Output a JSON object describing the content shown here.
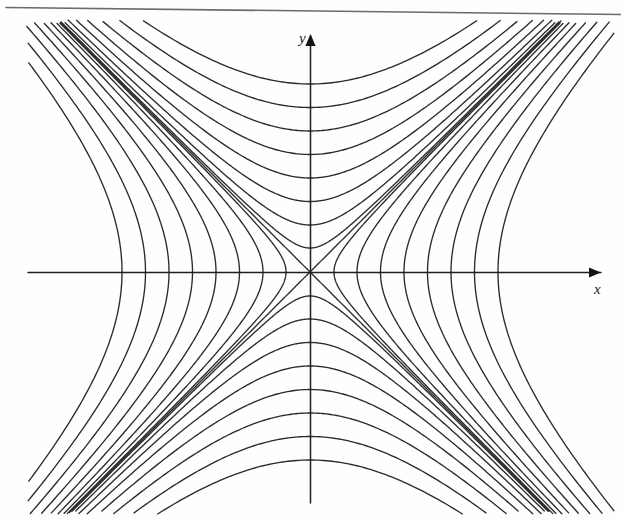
{
  "figure": {
    "title": "",
    "caption": "",
    "background_color": "#fefefe",
    "stroke_color": "#2b2b2b",
    "axis_color": "#1f1f1f",
    "labels": {
      "x_axis": "x",
      "y_axis": "y"
    },
    "icons": {
      "x_arrowhead": "arrow-right-icon",
      "y_arrowhead": "arrow-up-icon"
    },
    "artifact": {
      "name": "page-edge-line",
      "description": "scanned page border line across top"
    }
  },
  "chart_data": {
    "type": "line",
    "title": "",
    "subtitle": "",
    "xlabel": "x",
    "ylabel": "y",
    "grid": false,
    "legend_position": "none",
    "annotations": [
      "x",
      "y"
    ],
    "origin_px": [
      310,
      272
    ],
    "scale_px_per_unit": [
      47,
      47
    ],
    "xlim": [
      -6.0,
      6.6
    ],
    "ylim": [
      -5.2,
      5.0
    ],
    "axis_arrows": {
      "x": "right",
      "y": "up"
    },
    "series": [
      {
        "name": "asymptote y = x",
        "type": "asymptote",
        "equation": "y = x",
        "slope": 1
      },
      {
        "name": "asymptote y = -x",
        "type": "asymptote",
        "equation": "y = -x",
        "slope": -1
      },
      {
        "name": "x-axis",
        "type": "axis",
        "equation": "y = 0"
      },
      {
        "name": "y-axis",
        "type": "axis",
        "equation": "x = 0"
      },
      {
        "name": "horizontal family",
        "type": "hyperbola",
        "equation": "x^2 - y^2 = c",
        "opens": "left-right",
        "c_values": [
          0.26,
          1.0,
          2.25,
          4.0,
          6.25,
          9.0,
          12.25,
          16.0
        ]
      },
      {
        "name": "vertical family",
        "type": "hyperbola",
        "equation": "y^2 - x^2 = c",
        "opens": "up-down",
        "c_values": [
          0.26,
          1.0,
          2.25,
          4.0,
          6.25,
          9.0,
          12.25,
          16.0
        ]
      }
    ]
  }
}
